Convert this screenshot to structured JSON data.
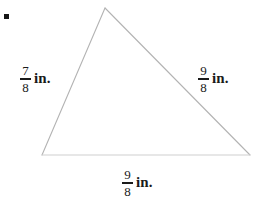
{
  "figure": {
    "kind": "geometry-triangle-diagram",
    "background_color": "#ffffff",
    "stroke_color": "#b3b3b3",
    "text_color": "#1a1a1a",
    "bullet": {
      "shape": "filled-square",
      "color": "#161616"
    },
    "triangle": {
      "vertices": {
        "apex": {
          "x": 105,
          "y": 8
        },
        "bottom_left": {
          "x": 42,
          "y": 155
        },
        "bottom_right": {
          "x": 250,
          "y": 155
        }
      },
      "path": "M 105 8 L 42 155 L 250 155 Z"
    },
    "labels": {
      "left": {
        "numerator": "7",
        "denominator": "8",
        "unit": "in."
      },
      "right": {
        "numerator": "9",
        "denominator": "8",
        "unit": "in."
      },
      "bottom": {
        "numerator": "9",
        "denominator": "8",
        "unit": "in."
      }
    }
  }
}
